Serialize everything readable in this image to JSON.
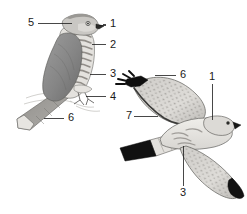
{
  "plate": {
    "title": "Bird identification plate",
    "background_color": "#ffffff",
    "label_color": "#1a1a1a",
    "leader_line_color": "#1a1a1a",
    "figures": [
      {
        "name": "perched-bird",
        "description": "Perched raptor in left profile, barred underparts, grey upperparts, long tail",
        "plumage_colors": {
          "upperparts": "#8a8a8a",
          "wing_dark": "#6f6f6f",
          "underparts": "#e2e0dc",
          "barring": "#9a9590",
          "tail": "#8f8d89",
          "outline": "#4a4a4a"
        }
      },
      {
        "name": "flying-bird",
        "description": "Raptor in flight from below, black wingtips, spotted underwing coverts, banded tail",
        "plumage_colors": {
          "wingtip_black": "#111111",
          "underwing": "#d6d4d0",
          "spotting": "#6e6b67",
          "body": "#e8e6e2",
          "tail_band": "#111111",
          "outline": "#4a4a4a"
        }
      }
    ]
  },
  "labels": [
    {
      "id": "label-5-perched",
      "text": "5",
      "x": 28,
      "y": 19,
      "figure": "perched-bird",
      "anchor": "crown"
    },
    {
      "id": "label-1-perched",
      "text": "1",
      "x": 110,
      "y": 19,
      "figure": "perched-bird",
      "anchor": "bill"
    },
    {
      "id": "label-2-perched",
      "text": "2",
      "x": 110,
      "y": 42,
      "figure": "perched-bird",
      "anchor": "breast-barring"
    },
    {
      "id": "label-3-perched",
      "text": "3",
      "x": 110,
      "y": 72,
      "figure": "perched-bird",
      "anchor": "flank-barring"
    },
    {
      "id": "label-4-perched",
      "text": "4",
      "x": 110,
      "y": 95,
      "figure": "perched-bird",
      "anchor": "legs"
    },
    {
      "id": "label-6-perched",
      "text": "6",
      "x": 68,
      "y": 113,
      "figure": "perched-bird",
      "anchor": "tail"
    },
    {
      "id": "label-6-flying",
      "text": "6",
      "x": 180,
      "y": 70,
      "figure": "flying-bird",
      "anchor": "tail"
    },
    {
      "id": "label-1-flying",
      "text": "1",
      "x": 209,
      "y": 71,
      "figure": "flying-bird",
      "anchor": "bill"
    },
    {
      "id": "label-7-flying",
      "text": "7",
      "x": 127,
      "y": 111,
      "figure": "flying-bird",
      "anchor": "underwing-coverts"
    },
    {
      "id": "label-3-flying",
      "text": "3",
      "x": 180,
      "y": 190,
      "figure": "flying-bird",
      "anchor": "belly-barring"
    }
  ]
}
